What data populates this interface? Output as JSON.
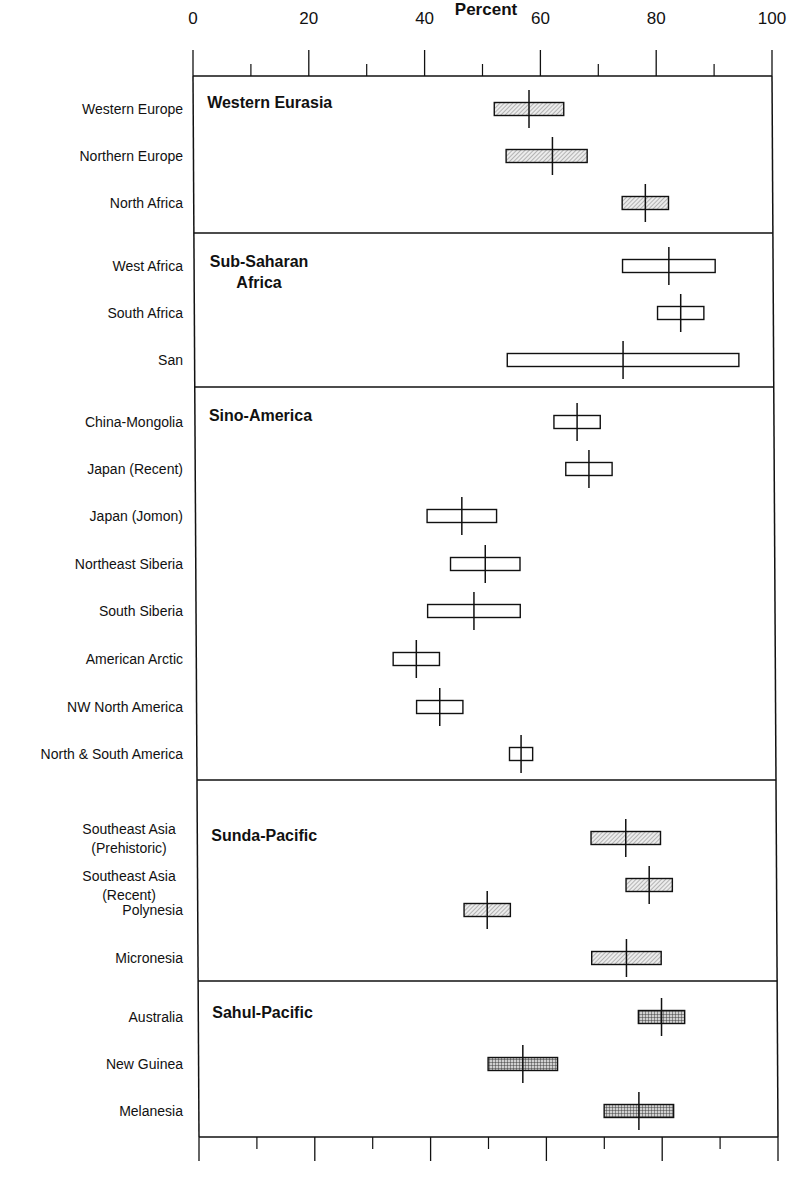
{
  "chart_data": {
    "type": "range-bar",
    "title": "",
    "xlabel": "Percent",
    "ylabel": "",
    "xlim": [
      0,
      100
    ],
    "x_ticks_major": [
      0,
      20,
      40,
      60,
      80,
      100
    ],
    "x_ticks_minor": [
      10,
      30,
      50,
      70,
      90
    ],
    "grid": false,
    "legend": null,
    "encoding": "Each row shows a box spanning a low–high range with a vertical line marking the central value.",
    "sections": [
      {
        "name": "Western Eurasia",
        "title_lines": [
          "Western Eurasia"
        ],
        "fill": "diagonal-hatch",
        "rows": [
          {
            "label": [
              "Western Europe"
            ],
            "low": 52,
            "high": 64,
            "mid": 58
          },
          {
            "label": [
              "Northern Europe"
            ],
            "low": 54,
            "high": 68,
            "mid": 62
          },
          {
            "label": [
              "North Africa"
            ],
            "low": 74,
            "high": 82,
            "mid": 78
          }
        ]
      },
      {
        "name": "Sub-Saharan Africa",
        "title_lines": [
          "Sub-Saharan",
          "Africa"
        ],
        "fill": "none",
        "rows": [
          {
            "label": [
              "West Africa"
            ],
            "low": 74,
            "high": 90,
            "mid": 82
          },
          {
            "label": [
              "South Africa"
            ],
            "low": 80,
            "high": 88,
            "mid": 84
          },
          {
            "label": [
              "San"
            ],
            "low": 54,
            "high": 94,
            "mid": 74
          }
        ]
      },
      {
        "name": "Sino-America",
        "title_lines": [
          "Sino-America"
        ],
        "fill": "none",
        "rows": [
          {
            "label": [
              "China-Mongolia"
            ],
            "low": 62,
            "high": 70,
            "mid": 66
          },
          {
            "label": [
              "Japan (Recent)"
            ],
            "low": 64,
            "high": 72,
            "mid": 68
          },
          {
            "label": [
              "Japan (Jomon)"
            ],
            "low": 40,
            "high": 52,
            "mid": 46
          },
          {
            "label": [
              "Northeast Siberia"
            ],
            "low": 44,
            "high": 56,
            "mid": 50
          },
          {
            "label": [
              "South Siberia"
            ],
            "low": 40,
            "high": 56,
            "mid": 48
          },
          {
            "label": [
              "American Arctic"
            ],
            "low": 34,
            "high": 42,
            "mid": 38
          },
          {
            "label": [
              "NW North America"
            ],
            "low": 38,
            "high": 46,
            "mid": 42
          },
          {
            "label": [
              "North & South America"
            ],
            "low": 54,
            "high": 58,
            "mid": 56
          }
        ]
      },
      {
        "name": "Sunda-Pacific",
        "title_lines": [
          "Sunda-Pacific"
        ],
        "fill": "diagonal-hatch",
        "rows": [
          {
            "label": [
              "Southeast Asia",
              "(Prehistoric)"
            ],
            "low": 68,
            "high": 80,
            "mid": 74
          },
          {
            "label": [
              "Southeast Asia",
              "(Recent)"
            ],
            "low": 74,
            "high": 82,
            "mid": 78
          },
          {
            "label": [
              "Polynesia"
            ],
            "low": 46,
            "high": 54,
            "mid": 50
          },
          {
            "label": [
              "Micronesia"
            ],
            "low": 68,
            "high": 80,
            "mid": 74
          }
        ]
      },
      {
        "name": "Sahul-Pacific",
        "title_lines": [
          "Sahul-Pacific"
        ],
        "fill": "crosshatch",
        "rows": [
          {
            "label": [
              "Australia"
            ],
            "low": 76,
            "high": 84,
            "mid": 80
          },
          {
            "label": [
              "New Guinea"
            ],
            "low": 50,
            "high": 62,
            "mid": 56
          },
          {
            "label": [
              "Melanesia"
            ],
            "low": 70,
            "high": 82,
            "mid": 76
          }
        ]
      }
    ]
  },
  "layout_rows_y": {
    "section_bounds": [
      76,
      233,
      387,
      780,
      981,
      1137
    ],
    "row_y": [
      [
        109,
        156,
        203
      ],
      [
        266,
        313,
        360
      ],
      [
        422,
        469,
        516,
        564,
        611,
        659,
        707,
        754
      ],
      [
        838,
        885,
        910,
        958
      ],
      [
        1017,
        1064,
        1111
      ]
    ],
    "title_y": [
      103,
      262,
      416,
      836,
      1013
    ]
  },
  "colors": {
    "ink": "#111111",
    "hatch_fill": "#d9d9d9",
    "crosshatch_fill": "#9a9a9a",
    "background": "#ffffff"
  }
}
